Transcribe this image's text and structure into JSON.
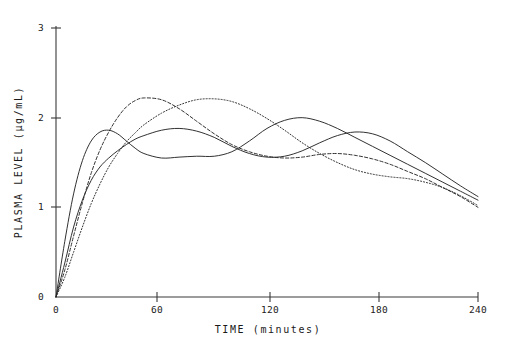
{
  "chart_data": {
    "type": "line",
    "title": "",
    "xlabel": "TIME  (minutes)",
    "ylabel": "PLASMA  LEVEL  (µg/mL)",
    "xlim": [
      0,
      240
    ],
    "ylim": [
      0,
      3
    ],
    "xticks": [
      0,
      60,
      120,
      180,
      240
    ],
    "xtick_labels": [
      "0",
      "60",
      "120",
      "180",
      "240"
    ],
    "yticks": [
      0,
      1,
      2,
      3
    ],
    "ytick_labels": [
      "0",
      "1",
      "2",
      "3"
    ],
    "grid": false,
    "legend": "none",
    "line_color": "#262626",
    "background": "#ffffff",
    "x": [
      0,
      5,
      10,
      15,
      20,
      25,
      30,
      35,
      40,
      45,
      50,
      60,
      70,
      80,
      90,
      100,
      110,
      120,
      130,
      140,
      150,
      160,
      170,
      180,
      190,
      200,
      210,
      220,
      230,
      240
    ],
    "series": [
      {
        "name": "Formulation A",
        "style": "solid",
        "values": [
          0.0,
          0.62,
          1.15,
          1.52,
          1.74,
          1.84,
          1.86,
          1.82,
          1.74,
          1.66,
          1.6,
          1.55,
          1.56,
          1.57,
          1.57,
          1.62,
          1.74,
          1.88,
          1.97,
          2.0,
          1.96,
          1.88,
          1.78,
          1.68,
          1.58,
          1.48,
          1.38,
          1.28,
          1.18,
          1.08
        ]
      },
      {
        "name": "Formulation B",
        "style": "solid",
        "values": [
          0.0,
          0.38,
          0.78,
          1.08,
          1.3,
          1.45,
          1.55,
          1.63,
          1.7,
          1.76,
          1.8,
          1.86,
          1.88,
          1.85,
          1.78,
          1.68,
          1.6,
          1.56,
          1.57,
          1.63,
          1.72,
          1.8,
          1.84,
          1.82,
          1.74,
          1.62,
          1.5,
          1.37,
          1.24,
          1.12
        ]
      },
      {
        "name": "Formulation C",
        "style": "dashed",
        "values": [
          0.0,
          0.3,
          0.68,
          1.05,
          1.38,
          1.64,
          1.84,
          2.0,
          2.12,
          2.19,
          2.22,
          2.2,
          2.1,
          1.96,
          1.82,
          1.7,
          1.62,
          1.57,
          1.55,
          1.56,
          1.59,
          1.6,
          1.58,
          1.54,
          1.48,
          1.4,
          1.32,
          1.22,
          1.12,
          1.0
        ]
      },
      {
        "name": "Formulation D",
        "style": "dotted",
        "values": [
          0.0,
          0.22,
          0.5,
          0.78,
          1.04,
          1.26,
          1.45,
          1.6,
          1.73,
          1.83,
          1.92,
          2.05,
          2.14,
          2.2,
          2.21,
          2.18,
          2.1,
          1.99,
          1.86,
          1.72,
          1.6,
          1.5,
          1.42,
          1.37,
          1.34,
          1.32,
          1.28,
          1.22,
          1.13,
          1.02
        ]
      }
    ]
  },
  "axes": {
    "y_title": "PLASMA  LEVEL  (µg/mL)",
    "x_title": "TIME  (minutes)",
    "ytick_0": "0",
    "ytick_1": "1",
    "ytick_2": "2",
    "ytick_3": "3",
    "xtick_0": "0",
    "xtick_60": "60",
    "xtick_120": "120",
    "xtick_180": "180",
    "xtick_240": "240"
  }
}
